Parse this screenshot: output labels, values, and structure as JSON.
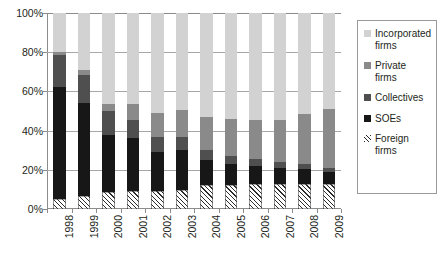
{
  "chart_data": {
    "type": "bar",
    "stacked": true,
    "stack_mode": "percent",
    "title": "",
    "subtitle": "",
    "xlabel": "",
    "ylabel": "",
    "ylim": [
      0,
      100
    ],
    "y_ticks": [
      0,
      20,
      40,
      60,
      80,
      100
    ],
    "y_tick_labels": [
      "0%",
      "20%",
      "40%",
      "60%",
      "80%",
      "100%"
    ],
    "grid": true,
    "legend_position": "right",
    "categories": [
      "1998",
      "1999",
      "2000",
      "2001",
      "2002",
      "2003",
      "2004",
      "2005",
      "2006",
      "2007",
      "2008",
      "2009"
    ],
    "x": [
      "1998",
      "1999",
      "2000",
      "2001",
      "2002",
      "2003",
      "2004",
      "2005",
      "2006",
      "2007",
      "2008",
      "2009"
    ],
    "series": [
      {
        "name": "Foreign firms",
        "key": "foreign",
        "color": "#ffffff",
        "pattern": "diagonal-hatch",
        "values": [
          5.0,
          6.5,
          8.5,
          9.0,
          9.0,
          9.5,
          12.5,
          12.5,
          13.0,
          13.0,
          13.0,
          13.0
        ]
      },
      {
        "name": "SOEs",
        "key": "soes",
        "color": "#171717",
        "values": [
          57.0,
          47.5,
          29.5,
          27.0,
          20.0,
          20.5,
          12.5,
          10.5,
          9.0,
          8.0,
          7.5,
          6.0
        ]
      },
      {
        "name": "Collectives",
        "key": "collectives",
        "color": "#4f4f4f",
        "values": [
          16.5,
          14.5,
          12.0,
          9.5,
          8.0,
          6.5,
          5.0,
          4.0,
          3.5,
          3.0,
          2.5,
          2.0
        ]
      },
      {
        "name": "Private firms",
        "key": "private",
        "color": "#8a8a8a",
        "values": [
          1.5,
          2.5,
          3.5,
          8.0,
          12.0,
          14.0,
          17.0,
          19.0,
          20.0,
          21.5,
          25.5,
          30.0
        ]
      },
      {
        "name": "Incorporated firms",
        "key": "incorporated",
        "color": "#d2d2d2",
        "values": [
          20.0,
          29.0,
          46.5,
          46.5,
          51.0,
          49.5,
          53.0,
          54.0,
          54.5,
          54.5,
          51.5,
          49.0
        ]
      }
    ],
    "stack_order_bottom_to_top": [
      "foreign",
      "soes",
      "collectives",
      "private",
      "incorporated"
    ]
  },
  "legend": {
    "items": [
      {
        "label_line1": "Incorporated",
        "label_line2": "firms",
        "swatch": "light-gray-swatch-icon",
        "color": "#d2d2d2"
      },
      {
        "label_line1": "Private",
        "label_line2": "firms",
        "swatch": "medium-gray-swatch-icon",
        "color": "#8a8a8a"
      },
      {
        "label_line1": "Collectives",
        "label_line2": "",
        "swatch": "dark-gray-swatch-icon",
        "color": "#4f4f4f"
      },
      {
        "label_line1": "SOEs",
        "label_line2": "",
        "swatch": "black-swatch-icon",
        "color": "#171717"
      },
      {
        "label_line1": "Foreign",
        "label_line2": "firms",
        "swatch": "hatch-swatch-icon",
        "color": "#ffffff"
      }
    ]
  },
  "axes": {
    "y_tick_labels": [
      "100%",
      "80%",
      "60%",
      "40%",
      "20%",
      "0%"
    ],
    "x_tick_labels": [
      "1998",
      "1999",
      "2000",
      "2001",
      "2002",
      "2003",
      "2004",
      "2005",
      "2006",
      "2007",
      "2008",
      "2009"
    ]
  }
}
